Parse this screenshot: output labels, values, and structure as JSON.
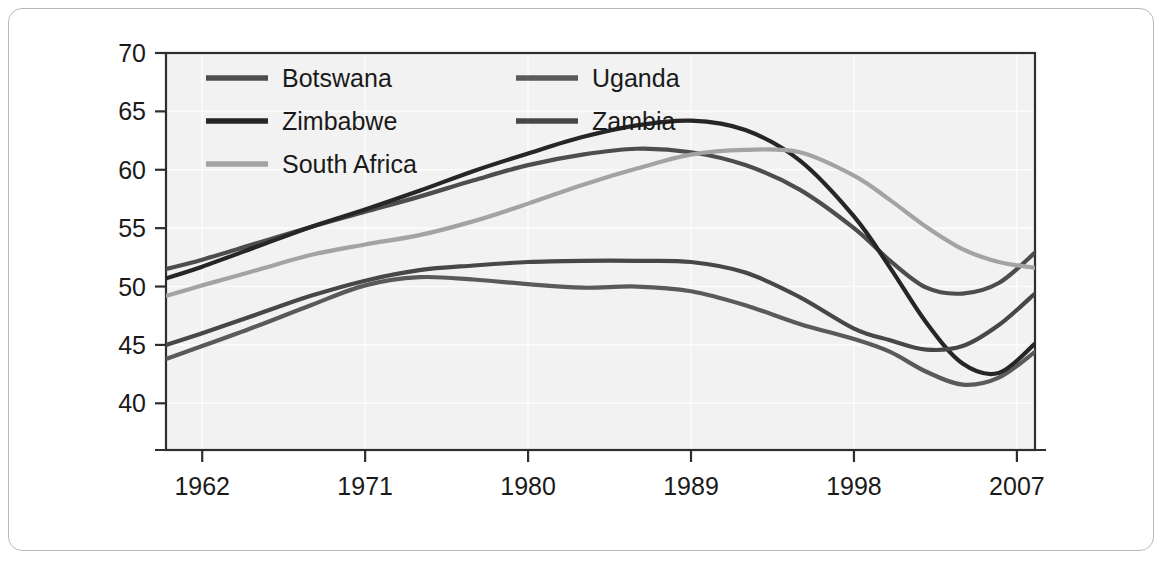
{
  "figure": {
    "background_color": "#ffffff",
    "panel_color": "#f2f2f2",
    "frame_color": "#b9b9b9"
  },
  "chart_data": {
    "type": "line",
    "title": "",
    "xlabel": "",
    "ylabel": "",
    "xlim": [
      1960,
      2008
    ],
    "ylim": [
      36,
      70
    ],
    "xticks": [
      1962,
      1971,
      1980,
      1989,
      1998,
      2007
    ],
    "xtick_labels": [
      "1962",
      "1971",
      "1980",
      "1989",
      "1998",
      "2007"
    ],
    "yticks": [
      40,
      45,
      50,
      55,
      60,
      65,
      70
    ],
    "ytick_labels": [
      "40",
      "45",
      "50",
      "55",
      "60",
      "65",
      "70"
    ],
    "grid": true,
    "legend_position": "top-left-inside",
    "x": [
      1960,
      1962,
      1965,
      1968,
      1971,
      1974,
      1977,
      1980,
      1983,
      1986,
      1989,
      1992,
      1995,
      1998,
      2000,
      2002,
      2004,
      2006,
      2008
    ],
    "series": [
      {
        "name": "Botswana",
        "color": "#4d4d4d",
        "values": [
          51.5,
          52.3,
          53.7,
          55.1,
          56.4,
          57.7,
          59.1,
          60.4,
          61.3,
          61.8,
          61.5,
          60.4,
          58.3,
          55.0,
          52.2,
          49.9,
          49.4,
          50.3,
          52.9
        ]
      },
      {
        "name": "Uganda",
        "color": "#5a5a5a",
        "values": [
          43.8,
          44.9,
          46.6,
          48.4,
          50.1,
          50.8,
          50.6,
          50.2,
          49.9,
          50.0,
          49.6,
          48.4,
          46.8,
          45.5,
          44.4,
          42.7,
          41.6,
          42.2,
          44.4
        ]
      },
      {
        "name": "Zimbabwe",
        "color": "#262626",
        "values": [
          50.7,
          51.7,
          53.4,
          55.1,
          56.6,
          58.2,
          59.9,
          61.4,
          62.8,
          63.8,
          64.2,
          63.4,
          60.8,
          56.0,
          51.6,
          46.9,
          43.4,
          42.6,
          45.1
        ]
      },
      {
        "name": "Zambia",
        "color": "#474747",
        "values": [
          45.0,
          46.0,
          47.6,
          49.2,
          50.5,
          51.4,
          51.8,
          52.1,
          52.2,
          52.2,
          52.1,
          51.2,
          49.1,
          46.4,
          45.4,
          44.6,
          44.9,
          46.7,
          49.4
        ]
      },
      {
        "name": "South Africa",
        "color": "#a3a3a3",
        "values": [
          49.2,
          50.1,
          51.4,
          52.7,
          53.6,
          54.4,
          55.6,
          57.1,
          58.7,
          60.1,
          61.3,
          61.7,
          61.5,
          59.5,
          57.4,
          55.1,
          53.2,
          52.1,
          51.6
        ]
      }
    ]
  },
  "legend": {
    "entries": [
      {
        "label": "Botswana",
        "color": "#4d4d4d"
      },
      {
        "label": "Uganda",
        "color": "#5a5a5a"
      },
      {
        "label": "Zimbabwe",
        "color": "#262626"
      },
      {
        "label": "Zambia",
        "color": "#474747"
      },
      {
        "label": "South Africa",
        "color": "#a3a3a3"
      }
    ]
  }
}
